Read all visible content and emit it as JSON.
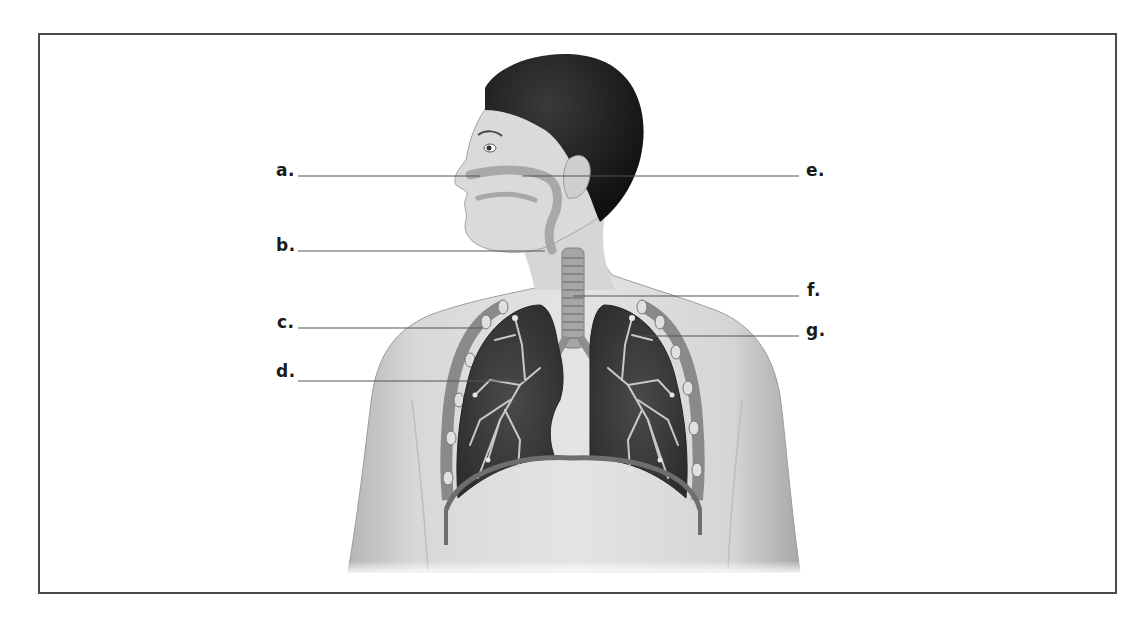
{
  "diagram": {
    "type": "labeled-anatomy-illustration",
    "labels": [
      {
        "id": "a",
        "text": "a.",
        "side": "left",
        "label_x": 276,
        "label_y": 162,
        "line": {
          "x1": 298,
          "y1": 176,
          "x2": 480,
          "y2": 176
        }
      },
      {
        "id": "b",
        "text": "b.",
        "side": "left",
        "label_x": 276,
        "label_y": 237,
        "line": {
          "x1": 298,
          "y1": 251,
          "x2": 545,
          "y2": 251
        }
      },
      {
        "id": "c",
        "text": "c.",
        "side": "left",
        "label_x": 277,
        "label_y": 314,
        "line": {
          "x1": 298,
          "y1": 328,
          "x2": 482,
          "y2": 328
        }
      },
      {
        "id": "d",
        "text": "d.",
        "side": "left",
        "label_x": 276,
        "label_y": 362,
        "line": {
          "x1": 298,
          "y1": 381,
          "x2": 525,
          "y2": 381
        }
      },
      {
        "id": "e",
        "text": "e.",
        "side": "right",
        "label_x": 806,
        "label_y": 162,
        "line": {
          "x1": 522,
          "y1": 176,
          "x2": 799,
          "y2": 176
        }
      },
      {
        "id": "f",
        "text": "f.",
        "side": "right",
        "label_x": 806,
        "label_y": 282,
        "line": {
          "x1": 573,
          "y1": 296,
          "x2": 799,
          "y2": 296
        }
      },
      {
        "id": "g",
        "text": "g.",
        "side": "right",
        "label_x": 806,
        "label_y": 323,
        "line": {
          "x1": 642,
          "y1": 336,
          "x2": 799,
          "y2": 336
        }
      }
    ],
    "colors": {
      "frame": "#4a4a4a",
      "leader_line": "#555555",
      "label_text": "#1a1a1a",
      "skin": "#d9d9d9",
      "skin_shadow": "#b8b8b8",
      "hair": "#1c1c1c",
      "lung": "#3a3a3a",
      "bronchi": "#c8c8c8",
      "airway": "#9a9a9a"
    }
  }
}
